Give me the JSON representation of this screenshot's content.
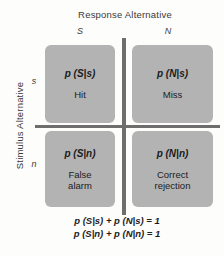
{
  "figure": {
    "column_axis_title": "Response Alternative",
    "row_axis_title": "Stimulus Alternative",
    "column_labels": [
      "S",
      "N"
    ],
    "row_labels": [
      "s",
      "n"
    ],
    "cells": [
      {
        "id": "hit",
        "probability": "p (S|s)",
        "outcome": "Hit"
      },
      {
        "id": "miss",
        "probability": "p (N|s)",
        "outcome": "Miss"
      },
      {
        "id": "false-alarm",
        "probability": "p (S|n)",
        "outcome": "False\nalarm"
      },
      {
        "id": "correct-rejection",
        "probability": "p (N|n)",
        "outcome": "Correct\nrejection"
      }
    ],
    "equations": [
      "p (S|s) + p (N|s) = 1",
      "p (S|n) + p (N|n) = 1"
    ],
    "colors": {
      "cell_fill": "#b3b3b3",
      "divider": "#6e6e6e",
      "text": "#1c1c1c",
      "background": "#fdfdfc"
    }
  }
}
